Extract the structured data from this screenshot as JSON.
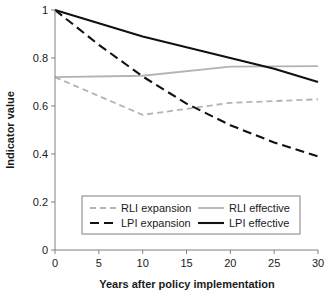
{
  "chart_data": {
    "type": "line",
    "title": "",
    "xlabel": "Years after policy implementation",
    "ylabel": "Indicator value",
    "xlim": [
      0,
      30
    ],
    "ylim": [
      0,
      1
    ],
    "xticks": [
      "0",
      "5",
      "10",
      "15",
      "20",
      "25",
      "30"
    ],
    "xtick_values": [
      0,
      5,
      10,
      15,
      20,
      25,
      30
    ],
    "yticks": [
      "0",
      "0.2",
      "0.4",
      "0.6",
      "0.8",
      "1"
    ],
    "ytick_values": [
      0,
      0.2,
      0.4,
      0.6,
      0.8,
      1
    ],
    "grid": false,
    "legend_position": "inside-bottom-center",
    "series": [
      {
        "name": "RLI expansion",
        "color": "#b3b3b3",
        "dash": "6,4",
        "width": 1.8,
        "x": [
          0,
          10,
          20,
          30
        ],
        "values": [
          0.72,
          0.563,
          0.613,
          0.628
        ]
      },
      {
        "name": "LPI expansion",
        "color": "#111111",
        "dash": "9,5",
        "width": 2.1,
        "x": [
          0,
          5,
          10,
          15,
          20,
          25,
          30
        ],
        "values": [
          1.0,
          0.855,
          0.723,
          0.61,
          0.52,
          0.448,
          0.39
        ]
      },
      {
        "name": "RLI effective",
        "color": "#b3b3b3",
        "dash": "",
        "width": 1.8,
        "x": [
          0,
          10,
          20,
          30
        ],
        "values": [
          0.72,
          0.726,
          0.764,
          0.766
        ]
      },
      {
        "name": "LPI effective",
        "color": "#111111",
        "dash": "",
        "width": 2.1,
        "x": [
          0,
          5,
          10,
          15,
          20,
          25,
          30
        ],
        "values": [
          1.0,
          0.945,
          0.89,
          0.845,
          0.8,
          0.755,
          0.7
        ]
      }
    ],
    "legend": [
      {
        "label": "RLI expansion",
        "color": "#b3b3b3",
        "dash": "6,4",
        "width": 1.8
      },
      {
        "label": "RLI effective",
        "color": "#b3b3b3",
        "dash": "",
        "width": 1.8
      },
      {
        "label": "LPI expansion",
        "color": "#111111",
        "dash": "9,5",
        "width": 2.1
      },
      {
        "label": "LPI effective",
        "color": "#111111",
        "dash": "",
        "width": 2.1
      }
    ]
  }
}
